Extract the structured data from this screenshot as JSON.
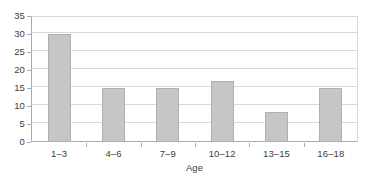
{
  "chart_data": {
    "type": "bar",
    "title": "",
    "subtitle": "",
    "xlabel": "Age",
    "ylabel": "",
    "categories": [
      "1–3",
      "4–6",
      "7–9",
      "10–12",
      "13–15",
      "16–18"
    ],
    "values": [
      30,
      15,
      15,
      17,
      8.3,
      15
    ],
    "ylim": [
      0,
      35
    ],
    "ytick_labels": [
      "0",
      "5",
      "10",
      "15",
      "20",
      "25",
      "30",
      "35"
    ],
    "ytick_values": [
      0,
      5,
      10,
      15,
      20,
      25,
      30,
      35
    ],
    "grid": "horizontal",
    "legend": "none",
    "series": [
      {
        "name": "",
        "values": [
          30,
          15,
          15,
          17,
          8.3,
          15
        ]
      }
    ],
    "colors": {
      "bar_fill": "#c6c6c6",
      "bar_stroke": "#b0b0b0",
      "gridline": "#d9d9d9",
      "axis": "#aaaaaa",
      "text": "#3d3d3d",
      "background": "#ffffff"
    }
  }
}
